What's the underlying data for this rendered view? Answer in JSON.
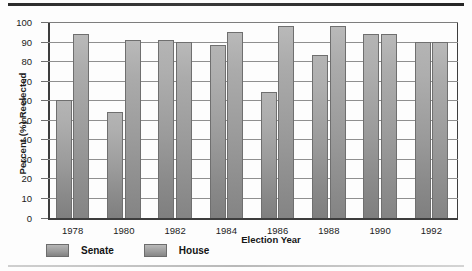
{
  "chart_data": {
    "type": "bar",
    "title": "",
    "xlabel": "Election Year",
    "ylabel": "Percent (%) Reelected",
    "categories": [
      "1978",
      "1980",
      "1982",
      "1984",
      "1986",
      "1988",
      "1990",
      "1992"
    ],
    "series": [
      {
        "name": "Senate",
        "values": [
          60,
          54,
          91,
          88,
          64,
          83,
          94,
          90
        ]
      },
      {
        "name": "House",
        "values": [
          94,
          91,
          90,
          95,
          98,
          98,
          94,
          90
        ]
      }
    ],
    "ylim": [
      0,
      100
    ],
    "ytick_labels": [
      "0",
      "10",
      "20",
      "30",
      "40",
      "50",
      "60",
      "70",
      "80",
      "90",
      "100"
    ],
    "ytick_values": [
      0,
      10,
      20,
      30,
      40,
      50,
      60,
      70,
      80,
      90,
      100
    ],
    "grid": true,
    "legend_position": "below-left",
    "legend": [
      "Senate",
      "House"
    ],
    "colors": {
      "senate": "#9a9a9a",
      "house": "#9b9b9b",
      "axis": "#3d3d3d",
      "grid": "#8f8f8f",
      "text": "#1b1b1b"
    }
  }
}
